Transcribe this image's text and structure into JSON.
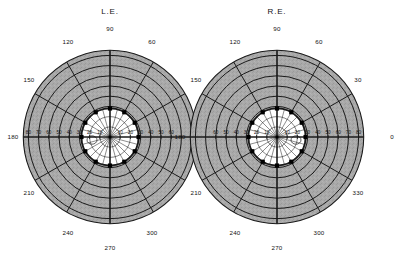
{
  "figure": {
    "title_hidden": "",
    "background_color": "#ffffff",
    "shade_color": "#a8a8a8",
    "field_color": "#ffffff",
    "line_color": "#1a1a1a",
    "marker_color": "#000000"
  },
  "eyes": [
    {
      "id": "left-eye",
      "label": "L.E.",
      "center": {
        "x": 110,
        "y": 137
      },
      "label_pos": {
        "x": 110,
        "y": 12
      },
      "meridian_labels": [
        {
          "text": "90",
          "angle": 90,
          "x": 110,
          "y": 29
        },
        {
          "text": "120",
          "angle": 120,
          "x": 68,
          "y": 42
        },
        {
          "text": "150",
          "angle": 150,
          "x": 29,
          "y": 80
        },
        {
          "text": "180",
          "angle": 180,
          "x": 13,
          "y": 137
        },
        {
          "text": "210",
          "angle": 210,
          "x": 29,
          "y": 193
        },
        {
          "text": "240",
          "angle": 240,
          "x": 68,
          "y": 233
        },
        {
          "text": "270",
          "angle": 270,
          "x": 110,
          "y": 248
        },
        {
          "text": "300",
          "angle": 300,
          "x": 152,
          "y": 233
        },
        {
          "text": "60",
          "angle": 60,
          "x": 152,
          "y": 42
        }
      ],
      "eccentricity_labels_left": [
        "80",
        "70",
        "60",
        "50",
        "40",
        "30",
        "20",
        "10"
      ],
      "eccentricity_labels_right": [
        "10",
        "20",
        "30",
        "40",
        "50",
        "60"
      ],
      "blind_spot": {
        "cx": 92,
        "cy": 140,
        "rx": 5.0,
        "ry": 4.2
      },
      "isopter_markers_deg": [
        0,
        30,
        60,
        90,
        120,
        150,
        180,
        210,
        240,
        270,
        300,
        330
      ]
    },
    {
      "id": "right-eye",
      "label": "R.E.",
      "center": {
        "x": 277,
        "y": 137
      },
      "label_pos": {
        "x": 277,
        "y": 12
      },
      "meridian_labels": [
        {
          "text": "90",
          "angle": 90,
          "x": 277,
          "y": 29
        },
        {
          "text": "120",
          "angle": 120,
          "x": 235,
          "y": 42
        },
        {
          "text": "150",
          "angle": 150,
          "x": 196,
          "y": 80
        },
        {
          "text": "180",
          "angle": 180,
          "x": 180,
          "y": 137
        },
        {
          "text": "210",
          "angle": 210,
          "x": 196,
          "y": 193
        },
        {
          "text": "240",
          "angle": 240,
          "x": 235,
          "y": 233
        },
        {
          "text": "270",
          "angle": 270,
          "x": 277,
          "y": 248
        },
        {
          "text": "300",
          "angle": 300,
          "x": 319,
          "y": 233
        },
        {
          "text": "330",
          "angle": 330,
          "x": 358,
          "y": 193
        },
        {
          "text": "0",
          "angle": 0,
          "x": 392,
          "y": 137
        },
        {
          "text": "30",
          "angle": 30,
          "x": 358,
          "y": 80
        },
        {
          "text": "60",
          "angle": 60,
          "x": 319,
          "y": 42
        }
      ],
      "eccentricity_labels_left": [
        "60",
        "50",
        "40",
        "30",
        "20",
        "10"
      ],
      "eccentricity_labels_right": [
        "10",
        "20",
        "30",
        "40",
        "50",
        "60",
        "70",
        "80"
      ],
      "blind_spot": {
        "cx": 296,
        "cy": 140,
        "rx": 5.0,
        "ry": 4.2
      },
      "isopter_markers_deg": [
        0,
        30,
        60,
        90,
        120,
        150,
        180,
        210,
        240,
        270,
        300,
        330
      ]
    }
  ],
  "scale": {
    "px_per_10deg": 10.2,
    "outer_radius_deg": 85,
    "isopter_radius_deg": 28,
    "ring_step_deg": 10,
    "inner_fine_rings_deg": [
      10,
      20
    ],
    "meridian_step_deg": 30
  },
  "chart_data": {
    "type": "line",
    "xlabel": "Meridian (degrees)",
    "ylabel": "Eccentricity (degrees)",
    "ylim": [
      0,
      85
    ],
    "grid": true,
    "legend": "none",
    "categories": [
      "0",
      "30",
      "60",
      "90",
      "120",
      "150",
      "180",
      "210",
      "240",
      "270",
      "300",
      "330"
    ],
    "series": [
      {
        "name": "L.E. isopter",
        "values": [
          28,
          28,
          28,
          28,
          28,
          28,
          28,
          28,
          28,
          28,
          28,
          28
        ]
      },
      {
        "name": "R.E. isopter",
        "values": [
          28,
          28,
          28,
          28,
          28,
          28,
          28,
          28,
          28,
          28,
          28,
          28
        ]
      },
      {
        "name": "L.E. peripheral limit",
        "values": [
          85,
          85,
          85,
          85,
          85,
          85,
          85,
          85,
          85,
          85,
          85,
          85
        ]
      },
      {
        "name": "R.E. peripheral limit",
        "values": [
          85,
          85,
          85,
          85,
          85,
          85,
          85,
          85,
          85,
          85,
          85,
          85
        ]
      }
    ],
    "annotations": [
      "L.E. blind spot at ~15 deg temporal",
      "R.E. blind spot at ~15 deg temporal",
      "Shaded annulus = relative field depression from 28 deg to 85 deg",
      "Unshaded central zone = seeing field inside 28 deg"
    ]
  }
}
